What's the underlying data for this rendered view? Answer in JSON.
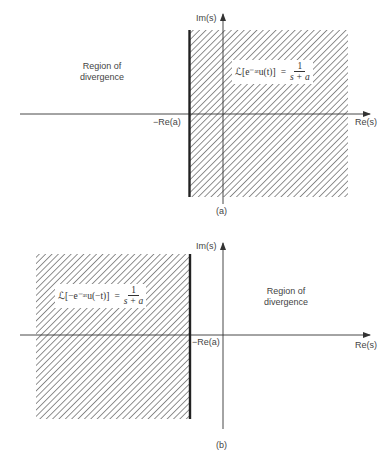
{
  "panels": [
    {
      "id": "a",
      "caption": "(a)",
      "im_axis_label": "Im(s)",
      "re_axis_label": "Re(s)",
      "boundary_label": "−Re(a)",
      "divergence_label_line1": "Region of",
      "divergence_label_line2": "divergence",
      "formula_lhs": "ℒ[e⁻ᵃᵗu(t)]",
      "formula_eq": "=",
      "formula_num": "1",
      "formula_den": "s + a",
      "convergence_side": "right"
    },
    {
      "id": "b",
      "caption": "(b)",
      "im_axis_label": "Im(s)",
      "re_axis_label": "Re(s)",
      "boundary_label": "−Re(a)",
      "divergence_label_line1": "Region of",
      "divergence_label_line2": "divergence",
      "formula_lhs": "ℒ[−e⁻ᵃᵗu(−t)]",
      "formula_eq": "=",
      "formula_num": "1",
      "formula_den": "s + a",
      "convergence_side": "left"
    }
  ],
  "colors": {
    "line": "#333333",
    "hatch": "#555555",
    "background": "#ffffff"
  }
}
